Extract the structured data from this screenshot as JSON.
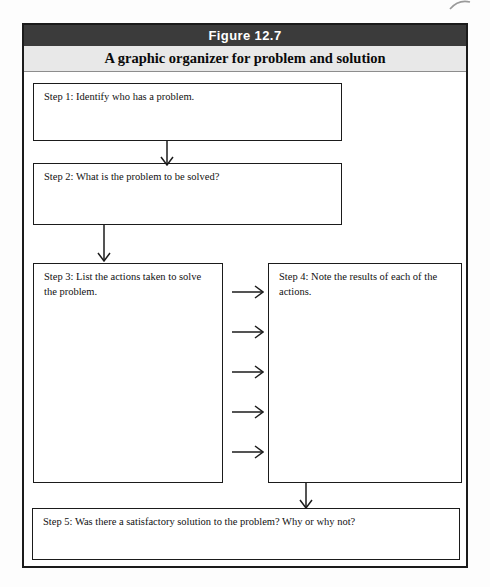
{
  "figure": {
    "label": "Figure 12.7",
    "title": "A graphic organizer for problem and solution"
  },
  "steps": [
    {
      "id": "step-1",
      "text": "Step 1: Identify who has a problem."
    },
    {
      "id": "step-2",
      "text": "Step 2: What is the problem to be solved?"
    },
    {
      "id": "step-3",
      "text": "Step 3: List the actions taken to solve the problem."
    },
    {
      "id": "step-4",
      "text": "Step 4: Note the results of each of the actions."
    },
    {
      "id": "step-5",
      "text": "Step 5: Was there a satisfactory solution to the problem? Why or why not?"
    }
  ],
  "colors": {
    "title_bar_bg": "#3b3b3b",
    "title_bar_text": "#ffffff",
    "subtitle_bar_bg": "#e8e8e8",
    "box_border": "#1b1b1b",
    "arrow": "#1b1b1b",
    "page_bg": "#ffffff"
  }
}
